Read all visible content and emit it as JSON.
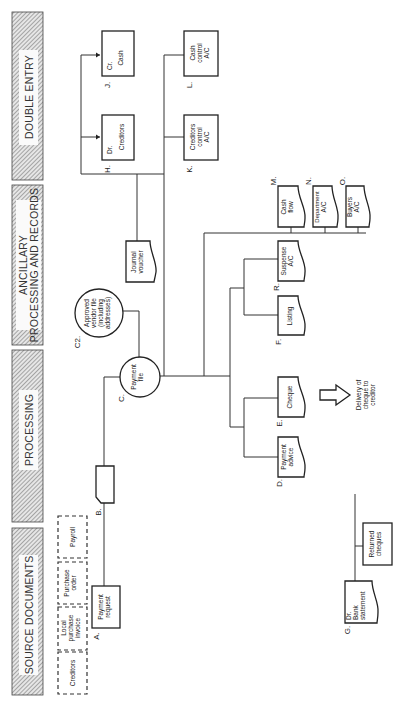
{
  "header_sections": [
    {
      "label": "DOUBLE ENTRY"
    },
    {
      "label_line1": "ANCILLARY",
      "label_line2": "PROCESSING AND RECORDS"
    },
    {
      "label": "PROCESSING"
    },
    {
      "label": "SOURCE DOCUMENTS"
    }
  ],
  "nodes": {
    "J": {
      "id": "J.",
      "prefix": "Cr.",
      "text": "Cash"
    },
    "H": {
      "id": "H.",
      "prefix": "Dr.",
      "text": "Creditors"
    },
    "L": {
      "id": "L.",
      "line1": "Cash",
      "line2": "control",
      "line3": "A/C"
    },
    "K": {
      "id": "K.",
      "line1": "Creditors",
      "line2": "control",
      "line3": "A/C"
    },
    "journal": {
      "line1": "Journal",
      "line2": "voucher"
    },
    "M": {
      "id": "M.",
      "line1": "Cash",
      "line2": "flow"
    },
    "N": {
      "id": "N.",
      "line1": "Department",
      "line2": "A/C"
    },
    "O": {
      "id": "O.",
      "line1": "Buyers",
      "line2": "A/C"
    },
    "R": {
      "id": "R.",
      "line1": "Suspense",
      "line2": "A/C"
    },
    "F": {
      "id": "F.",
      "line1": "Listing"
    },
    "C2": {
      "id": "C2.",
      "line1": "Approved",
      "line2": "vendor file",
      "line3": "(including",
      "line4": "addresses)"
    },
    "C": {
      "id": "C.",
      "line1": "Payment",
      "line2": "file"
    },
    "E": {
      "id": "E.",
      "line1": "Cheque"
    },
    "D": {
      "id": "D.",
      "line1": "Payment",
      "line2": "advice"
    },
    "B": {
      "id": "B."
    },
    "A": {
      "id": "A.",
      "line1": "Payment",
      "line2": "request"
    },
    "delivery": {
      "line1": "Delivery of",
      "line2": "cheque to",
      "line3": "creditor"
    },
    "returned": {
      "line1": "Returned",
      "line2": "cheques"
    },
    "G": {
      "id": "G.",
      "prefix": "Dr.",
      "line1": "Bank",
      "line2": "statement"
    }
  },
  "source_documents": [
    {
      "line1": "Payroll"
    },
    {
      "line1": "Purchase",
      "line2": "order"
    },
    {
      "line1": "Local",
      "line2": "purchase",
      "line3": "invoice"
    },
    {
      "line1": "Creditors"
    }
  ],
  "colors": {
    "ink": "#222222",
    "hatch": "#777777",
    "background": "#ffffff"
  }
}
